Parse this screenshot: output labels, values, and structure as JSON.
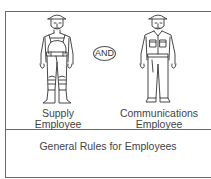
{
  "diagram": {
    "left_figure": {
      "icon": "supply-employee-figure-icon",
      "label_line1": "Supply",
      "label_line2": "Employee"
    },
    "connector": {
      "label": "AND"
    },
    "right_figure": {
      "icon": "communications-employee-figure-icon",
      "label_line1": "Communications",
      "label_line2": "Employee"
    },
    "footer": {
      "title": "General Rules for Employees"
    },
    "colors": {
      "line": "#6a6a6a",
      "text": "#444444",
      "background": "#ffffff"
    }
  }
}
